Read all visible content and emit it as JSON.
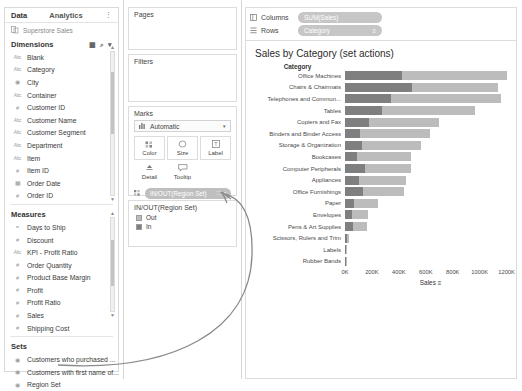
{
  "data_pane": {
    "tabs": [
      {
        "label": "Data"
      },
      {
        "label": "Analytics"
      }
    ],
    "more_icon": "⋮",
    "datasource": {
      "label": "Superstore Sales",
      "icon": "datasource-icon"
    },
    "dimensions": {
      "title": "Dimensions",
      "grid_icon": "▦",
      "search_icon": "⌕",
      "caret_icon": "▾",
      "items": [
        {
          "label": "Blank",
          "type": "Abc"
        },
        {
          "label": "Category",
          "type": "Abc"
        },
        {
          "label": "City",
          "type": "globe"
        },
        {
          "label": "Container",
          "type": "Abc"
        },
        {
          "label": "Customer ID",
          "type": "hash"
        },
        {
          "label": "Customer Name",
          "type": "Abc"
        },
        {
          "label": "Customer Segment",
          "type": "Abc"
        },
        {
          "label": "Department",
          "type": "Abc"
        },
        {
          "label": "Item",
          "type": "Abc"
        },
        {
          "label": "Item ID",
          "type": "hash"
        },
        {
          "label": "Order Date",
          "type": "calendar"
        },
        {
          "label": "Order ID",
          "type": "hash"
        }
      ]
    },
    "measures": {
      "title": "Measures",
      "items": [
        {
          "label": "Days to Ship",
          "type": "eq"
        },
        {
          "label": "Discount",
          "type": "hash"
        },
        {
          "label": "KPI - Profit Ratio",
          "type": "Abc"
        },
        {
          "label": "Order Quantity",
          "type": "hash"
        },
        {
          "label": "Product Base Margin",
          "type": "hash"
        },
        {
          "label": "Profit",
          "type": "hash"
        },
        {
          "label": "Profit Ratio",
          "type": "hash"
        },
        {
          "label": "Sales",
          "type": "hash"
        },
        {
          "label": "Shipping Cost",
          "type": "hash"
        }
      ]
    },
    "sets": {
      "title": "Sets",
      "items": [
        {
          "label": "Customers who purchased ...",
          "type": "set"
        },
        {
          "label": "Customers with first name of...",
          "type": "set"
        },
        {
          "label": "Region Set",
          "type": "set"
        }
      ]
    }
  },
  "mid_pane": {
    "pages": {
      "title": "Pages"
    },
    "filters": {
      "title": "Filters"
    },
    "marks": {
      "title": "Marks",
      "mark_type": "Automatic",
      "mark_type_icon": "bar-icon",
      "caret": "▾",
      "buttons": [
        {
          "label": "Color",
          "icon": "color-icon"
        },
        {
          "label": "Size",
          "icon": "size-icon"
        },
        {
          "label": "Label",
          "icon": "label-icon"
        },
        {
          "label": "Detail",
          "icon": "detail-icon"
        },
        {
          "label": "Tooltip",
          "icon": "tooltip-icon"
        }
      ],
      "pill": {
        "label": "IN/OUT(Region Set)",
        "icons": "⛶ ≡"
      }
    },
    "legend": {
      "title": "IN/OUT(Region Set)",
      "items": [
        {
          "label": "Out",
          "color": "#bcbcbc"
        },
        {
          "label": "In",
          "color": "#7f7f7f"
        }
      ]
    }
  },
  "viz": {
    "shelves": [
      {
        "name": "Columns",
        "pill": "SUM(Sales)",
        "sort": ""
      },
      {
        "name": "Rows",
        "pill": "Category",
        "sort": "≡"
      }
    ],
    "title": "Sales by Category (set actions)",
    "row_header": "Category",
    "axis_sort_icon": "≡"
  },
  "chart_data": {
    "type": "bar",
    "title": "Sales by Category (set actions)",
    "xlabel": "Sales",
    "ylabel": "Category",
    "xlim": [
      0,
      1270
    ],
    "xticks": [
      0,
      200,
      400,
      600,
      800,
      1000,
      1200
    ],
    "xtick_labels": [
      "0K",
      "200K",
      "400K",
      "600K",
      "800K",
      "1000K",
      "1200K"
    ],
    "grid": false,
    "legend_position": "left-panel",
    "stacked": true,
    "categories": [
      "Office Machines",
      "Chairs & Chairmats",
      "Telephones and Commun...",
      "Tables",
      "Copiers and Fax",
      "Binders and Binder Access",
      "Storage & Organization",
      "Bookcases",
      "Computer Peripherals",
      "Appliances",
      "Office Furnishings",
      "Paper",
      "Envelopes",
      "Pens & Art Supplies",
      "Scissors, Rulers and Trim",
      "Labels",
      "Rubber Bands"
    ],
    "series": [
      {
        "name": "In",
        "color": "#7f7f7f",
        "values": [
          425,
          500,
          345,
          275,
          175,
          110,
          125,
          88,
          148,
          105,
          130,
          65,
          50,
          58,
          16,
          8,
          4
        ]
      },
      {
        "name": "Out",
        "color": "#bcbcbc",
        "values": [
          775,
          640,
          810,
          690,
          525,
          520,
          440,
          405,
          345,
          350,
          310,
          180,
          120,
          105,
          14,
          6,
          2
        ]
      }
    ],
    "totals": [
      1200,
      1140,
      1155,
      965,
      700,
      630,
      565,
      493,
      493,
      455,
      440,
      245,
      170,
      163,
      30,
      14,
      6
    ]
  }
}
